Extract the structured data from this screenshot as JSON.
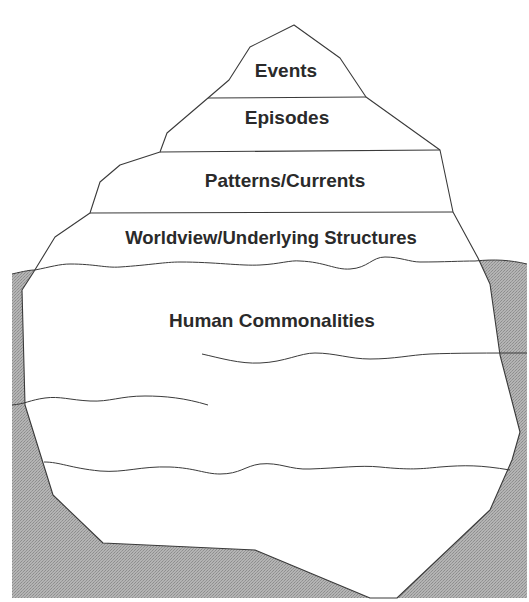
{
  "diagram": {
    "type": "iceberg",
    "layers_above_water": [
      {
        "label": "Events"
      },
      {
        "label": "Episodes"
      },
      {
        "label": "Patterns/Currents"
      },
      {
        "label": "Worldview/Underlying Structures"
      }
    ],
    "layers_below_water": [
      {
        "label": "Human Commonalities"
      }
    ],
    "colors": {
      "ice": "#ffffff",
      "water": "#a8a8a8",
      "outline": "#3a3a3a",
      "text": "#2a2a2a"
    }
  }
}
